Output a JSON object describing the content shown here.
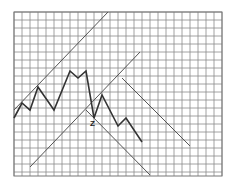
{
  "chart_data": {
    "type": "line",
    "title": "",
    "xlabel": "",
    "ylabel": "",
    "grid": true,
    "legend": null,
    "plot_area_px": {
      "x0": 14,
      "y0": 12,
      "x1": 222,
      "y1": 176
    },
    "grid_spacing_px": 8,
    "colors": {
      "grid": "#8a8a8a",
      "price": "#333333",
      "trendline": "#555555",
      "background": "#ffffff"
    },
    "series": [
      {
        "name": "price",
        "points_px": [
          [
            14,
            118
          ],
          [
            22,
            103
          ],
          [
            30,
            110
          ],
          [
            38,
            87
          ],
          [
            54,
            110
          ],
          [
            70,
            71
          ],
          [
            78,
            78
          ],
          [
            86,
            71
          ],
          [
            94,
            118
          ],
          [
            102,
            95
          ],
          [
            118,
            126
          ],
          [
            126,
            118
          ],
          [
            142,
            142
          ]
        ]
      }
    ],
    "trendlines": [
      {
        "name": "upper-trendline",
        "from": [
          14,
          110
        ],
        "to": [
          108,
          12
        ]
      },
      {
        "name": "middle-trendline",
        "from": [
          30,
          167
        ],
        "to": [
          140,
          52
        ]
      },
      {
        "name": "lower-channel-line",
        "from": [
          86,
          110
        ],
        "to": [
          150,
          175
        ]
      },
      {
        "name": "right-channel-line",
        "from": [
          122,
          78
        ],
        "to": [
          190,
          146
        ]
      }
    ],
    "annotations": [
      {
        "text": "Z",
        "x": 90,
        "y": 126
      }
    ]
  }
}
